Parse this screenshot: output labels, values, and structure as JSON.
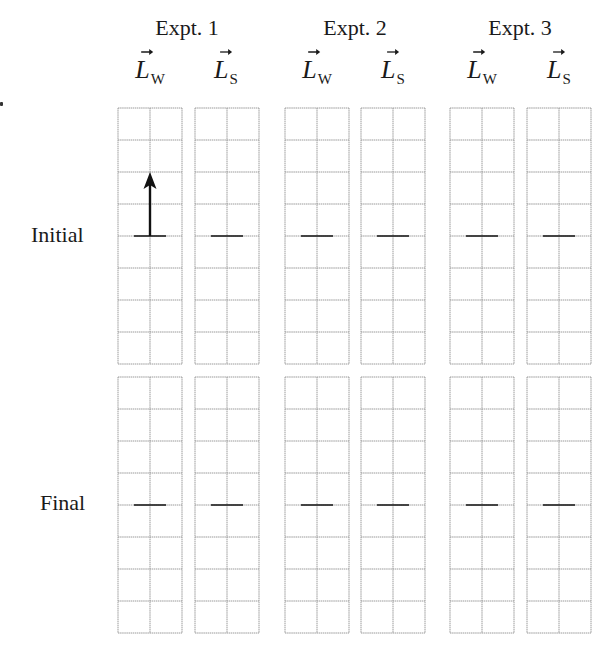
{
  "experiments": [
    {
      "title": "Expt. 1",
      "center_x": 187
    },
    {
      "title": "Expt. 2",
      "center_x": 355
    },
    {
      "title": "Expt. 3",
      "center_x": 520
    }
  ],
  "vector_labels": [
    {
      "symbol": "L",
      "subscript": "W",
      "center_x": 150
    },
    {
      "symbol": "L",
      "subscript": "S",
      "center_x": 226
    },
    {
      "symbol": "L",
      "subscript": "W",
      "center_x": 317
    },
    {
      "symbol": "L",
      "subscript": "S",
      "center_x": 393
    },
    {
      "symbol": "L",
      "subscript": "W",
      "center_x": 482
    },
    {
      "symbol": "L",
      "subscript": "S",
      "center_x": 559
    }
  ],
  "rows": [
    {
      "label": "Initial",
      "label_x": 31,
      "label_y": 224
    },
    {
      "label": "Final",
      "label_x": 40,
      "label_y": 492
    }
  ],
  "grid": {
    "columns_x": [
      118,
      195,
      285,
      361,
      450,
      527
    ],
    "column_width": 64,
    "cells_wide": 2,
    "cells_tall": 8,
    "cell_size": 32,
    "rows_y": [
      108,
      377
    ],
    "line_color": "#9a9a9a"
  },
  "markers": {
    "baseline_row_index": 4,
    "tick_width": 32,
    "tick_color": "#333333"
  },
  "arrows": [
    {
      "grid_row": 0,
      "grid_col": 0,
      "direction": "up",
      "length_units": 2,
      "color": "#111111"
    }
  ]
}
